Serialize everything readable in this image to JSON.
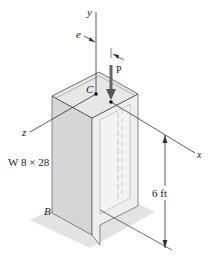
{
  "figure": {
    "axes": {
      "y": "y",
      "x": "x",
      "z": "z"
    },
    "labels": {
      "eccentricity": "e",
      "load": "P",
      "centroid": "C",
      "base_corner": "B",
      "section": "W 8 × 28",
      "height": "6 ft"
    },
    "colors": {
      "column_face_left": "#d9d9d9",
      "column_face_right": "#efefef",
      "top_face": "#e6e6e6",
      "base_shadow": "#e2e2e2",
      "line": "#333333"
    }
  }
}
